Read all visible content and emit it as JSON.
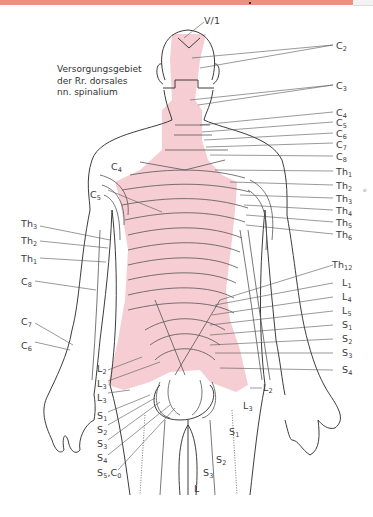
{
  "banner": {
    "color": "#ef8f82"
  },
  "caption": {
    "line1": "Versorgungsgebiet",
    "line2": "der Rr. dorsales",
    "line3": "nn. spinalium"
  },
  "colors": {
    "pink_region": "#f5cdd3",
    "outline": "#3c3c3c",
    "line": "#555555"
  },
  "labels": {
    "head": {
      "v1": "V/1"
    },
    "right": [
      {
        "b": "C",
        "s": "2"
      },
      {
        "b": "C",
        "s": "3"
      },
      {
        "b": "C",
        "s": "4"
      },
      {
        "b": "C",
        "s": "5"
      },
      {
        "b": "C",
        "s": "6"
      },
      {
        "b": "C",
        "s": "7"
      },
      {
        "b": "C",
        "s": "8"
      },
      {
        "b": "Th",
        "s": "1"
      },
      {
        "b": "Th",
        "s": "2"
      },
      {
        "b": "Th",
        "s": "3"
      },
      {
        "b": "Th",
        "s": "4"
      },
      {
        "b": "Th",
        "s": "5"
      },
      {
        "b": "Th",
        "s": "6"
      },
      {
        "b": "Th",
        "s": "12"
      },
      {
        "b": "L",
        "s": "1"
      },
      {
        "b": "L",
        "s": "4"
      },
      {
        "b": "L",
        "s": "5"
      },
      {
        "b": "S",
        "s": "1"
      },
      {
        "b": "S",
        "s": "2"
      },
      {
        "b": "S",
        "s": "3"
      },
      {
        "b": "S",
        "s": "4"
      }
    ],
    "left_arm": [
      {
        "b": "C",
        "s": "4"
      },
      {
        "b": "C",
        "s": "5"
      },
      {
        "b": "Th",
        "s": "3"
      },
      {
        "b": "Th",
        "s": "2"
      },
      {
        "b": "Th",
        "s": "1"
      },
      {
        "b": "C",
        "s": "8"
      },
      {
        "b": "C",
        "s": "7"
      },
      {
        "b": "C",
        "s": "6"
      }
    ],
    "left_lower": [
      {
        "b": "L",
        "s": "2"
      },
      {
        "b": "L",
        "s": "3"
      },
      {
        "b": "L",
        "s": "3"
      },
      {
        "b": "S",
        "s": "1"
      },
      {
        "b": "S",
        "s": "2"
      },
      {
        "b": "S",
        "s": "3"
      },
      {
        "b": "S",
        "s": "4"
      },
      {
        "b": "S",
        "s": "5",
        "extra": ",C",
        "extra_s": "0"
      }
    ],
    "legs": [
      {
        "b": "L",
        "s": "2"
      },
      {
        "b": "L",
        "s": "3"
      },
      {
        "b": "S",
        "s": "1"
      },
      {
        "b": "S",
        "s": "2"
      },
      {
        "b": "S",
        "s": "3"
      },
      {
        "b": "L",
        "s": ""
      }
    ]
  }
}
